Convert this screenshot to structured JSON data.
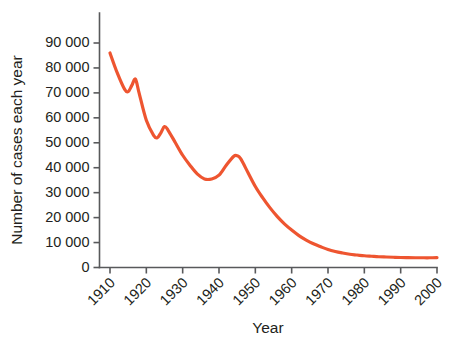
{
  "chart_data": {
    "type": "line",
    "title": "",
    "xlabel": "Year",
    "ylabel": "Number of cases each year",
    "xlim": [
      1910,
      2000
    ],
    "ylim": [
      0,
      95000
    ],
    "grid": false,
    "legend": null,
    "line_color": "#ee5530",
    "axis_color": "#58595b",
    "x_tick_labels": [
      "1910",
      "1920",
      "1930",
      "1940",
      "1950",
      "1960",
      "1970",
      "1980",
      "1990",
      "2000"
    ],
    "x_ticks": [
      1910,
      1920,
      1930,
      1940,
      1950,
      1960,
      1970,
      1980,
      1990,
      2000
    ],
    "y_tick_labels": [
      "0",
      "10 000",
      "20 000",
      "30 000",
      "40 000",
      "50 000",
      "60 000",
      "70 000",
      "80 000",
      "90 000"
    ],
    "y_ticks": [
      0,
      10000,
      20000,
      30000,
      40000,
      50000,
      60000,
      70000,
      80000,
      90000
    ],
    "series": [
      {
        "name": "Number of cases each year",
        "x": [
          1910,
          1912,
          1914,
          1915,
          1916,
          1917,
          1918,
          1920,
          1922,
          1923,
          1924,
          1925,
          1926,
          1928,
          1930,
          1932,
          1934,
          1936,
          1938,
          1940,
          1942,
          1944,
          1945,
          1946,
          1948,
          1950,
          1952,
          1954,
          1956,
          1958,
          1960,
          1962,
          1964,
          1966,
          1968,
          1970,
          1972,
          1974,
          1976,
          1978,
          1980,
          1982,
          1984,
          1986,
          1988,
          1990,
          1992,
          1994,
          1996,
          1998,
          2000
        ],
        "values": [
          86000,
          78000,
          71500,
          70500,
          73000,
          75500,
          70000,
          59000,
          53000,
          52000,
          54000,
          56500,
          55000,
          50000,
          45000,
          41000,
          37500,
          35500,
          35500,
          37000,
          41000,
          44500,
          44800,
          43500,
          38000,
          32500,
          28000,
          24000,
          20500,
          17500,
          15000,
          12800,
          11000,
          9500,
          8300,
          7200,
          6400,
          5800,
          5300,
          5000,
          4700,
          4500,
          4300,
          4200,
          4100,
          4000,
          3950,
          3900,
          3900,
          3900,
          3950
        ]
      }
    ],
    "annotations": []
  }
}
